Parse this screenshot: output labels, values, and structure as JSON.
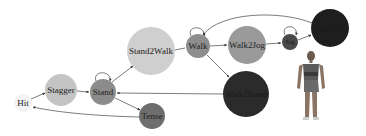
{
  "diagram": {
    "type": "state-machine",
    "nodes": [
      {
        "id": "hit",
        "label": "Hit",
        "cx": 23,
        "cy": 103,
        "r": 9,
        "color": "#f2f2f2"
      },
      {
        "id": "stagger",
        "label": "Stagger",
        "cx": 61,
        "cy": 90,
        "r": 16,
        "color": "#c4c4c4"
      },
      {
        "id": "stand",
        "label": "Stand",
        "cx": 103,
        "cy": 92,
        "r": 13,
        "color": "#8c8c8c"
      },
      {
        "id": "stand2walk",
        "label": "Stand2Walk",
        "cx": 151,
        "cy": 51,
        "r": 24,
        "color": "#cfcfcf"
      },
      {
        "id": "tense",
        "label": "Tense",
        "cx": 152,
        "cy": 116,
        "r": 13,
        "color": "#6e6e6e"
      },
      {
        "id": "walk",
        "label": "Walk",
        "cx": 198,
        "cy": 46,
        "r": 12,
        "color": "#8e8e8e"
      },
      {
        "id": "walk2jog",
        "label": "Walk2Jog",
        "cx": 247,
        "cy": 45,
        "r": 19,
        "color": "#9a9a9a"
      },
      {
        "id": "walk2stand",
        "label": "Walk2Stand",
        "cx": 246,
        "cy": 94,
        "r": 23,
        "color": "#2b2b2b"
      },
      {
        "id": "jog",
        "label": "Jog",
        "cx": 290,
        "cy": 42,
        "r": 8,
        "color": "#4a4a4a"
      },
      {
        "id": "jog2walk",
        "label": "Jog2Walk",
        "cx": 330,
        "cy": 28,
        "r": 19,
        "color": "#1e1e1e"
      }
    ],
    "edges": [
      {
        "from": "hit",
        "to": "stagger"
      },
      {
        "from": "stagger",
        "to": "stand"
      },
      {
        "from": "stand",
        "to": "stand",
        "self_loop": true
      },
      {
        "from": "stand",
        "to": "stand2walk"
      },
      {
        "from": "stand",
        "to": "tense"
      },
      {
        "from": "tense",
        "to": "hit"
      },
      {
        "from": "stand2walk",
        "to": "walk"
      },
      {
        "from": "walk",
        "to": "walk",
        "self_loop": true
      },
      {
        "from": "walk",
        "to": "walk2jog"
      },
      {
        "from": "walk",
        "to": "walk2stand"
      },
      {
        "from": "walk2stand",
        "to": "stand"
      },
      {
        "from": "walk2jog",
        "to": "jog"
      },
      {
        "from": "jog",
        "to": "jog",
        "self_loop": true
      },
      {
        "from": "jog",
        "to": "jog2walk"
      },
      {
        "from": "jog2walk",
        "to": "walk"
      }
    ],
    "figure": {
      "description": "character-figure",
      "x": 296,
      "y": 50,
      "width": 30,
      "height": 74
    }
  }
}
